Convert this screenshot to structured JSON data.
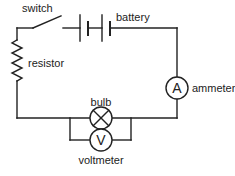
{
  "diagram": {
    "type": "series circuit",
    "components": {
      "switch": {
        "label": "switch",
        "state": "open"
      },
      "battery": {
        "label": "battery",
        "cells": 2
      },
      "resistor": {
        "label": "resistor"
      },
      "ammeter": {
        "label": "ammeter",
        "symbol": "A"
      },
      "bulb": {
        "label": "bulb"
      },
      "voltmeter": {
        "label": "voltmeter",
        "symbol": "V"
      }
    },
    "caption": "..."
  },
  "colors": {
    "line": "#222222",
    "background": "#ffffff"
  }
}
